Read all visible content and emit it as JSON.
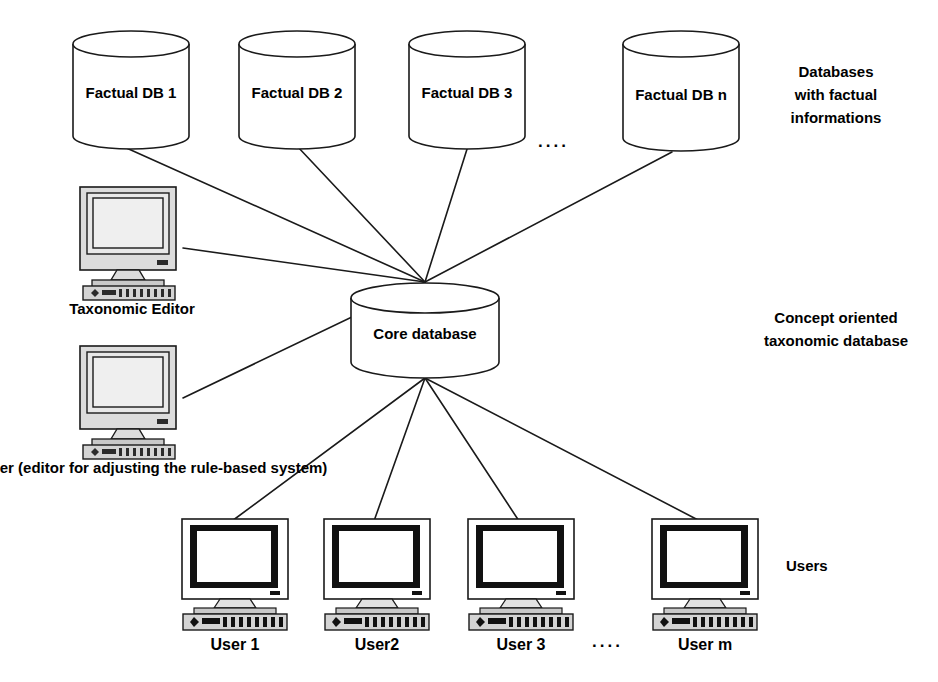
{
  "diagram": {
    "background_color": "#ffffff",
    "line_color": "#1a1a1a",
    "text_color": "#000000",
    "bezel_color": "#d9d9d9"
  },
  "databases": {
    "items": [
      {
        "label": "Factual DB 1"
      },
      {
        "label": "Factual DB 2"
      },
      {
        "label": "Factual DB 3"
      },
      {
        "label": "Factual DB n"
      }
    ],
    "ellipsis": "....",
    "annotation": "Databases\nwith factual\ninformations"
  },
  "core": {
    "label": "Core database",
    "annotation": "Concept oriented\ntaxonomic database"
  },
  "editors": {
    "items": [
      {
        "label": "Taxonomic Editor",
        "icon": "workstation-icon"
      },
      {
        "label": "Rule Tuner\n(editor for adjusting\nthe rule-based system)",
        "icon": "workstation-icon"
      }
    ]
  },
  "users": {
    "items": [
      {
        "label": "User  1",
        "icon": "user-workstation-icon"
      },
      {
        "label": "User2",
        "icon": "user-workstation-icon"
      },
      {
        "label": "User  3",
        "icon": "user-workstation-icon"
      },
      {
        "label": "User  m",
        "icon": "user-workstation-icon"
      }
    ],
    "ellipsis": "....",
    "annotation": "Users"
  }
}
